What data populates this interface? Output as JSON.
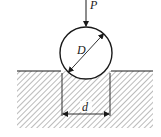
{
  "diagram": {
    "type": "brinell-hardness-indentation",
    "labels": {
      "force": "P",
      "ball_diameter": "D",
      "indent_diameter": "d"
    },
    "colors": {
      "line": "#1a1a1a",
      "hatch": "#555555",
      "background": "#ffffff"
    }
  }
}
